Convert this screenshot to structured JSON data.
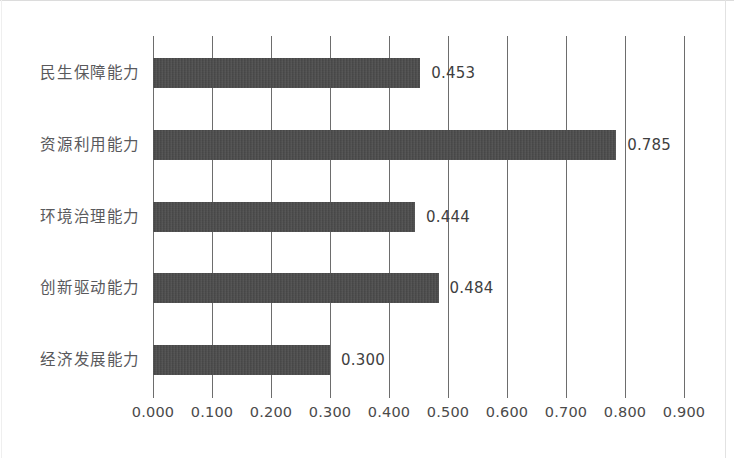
{
  "chart_data": {
    "type": "bar",
    "orientation": "horizontal",
    "title": "",
    "subtitle": "",
    "xlabel": "",
    "ylabel": "",
    "categories": [
      "民生保障能力",
      "资源利用能力",
      "环境治理能力",
      "创新驱动能力",
      "经济发展能力"
    ],
    "values": [
      0.453,
      0.785,
      0.444,
      0.484,
      0.3
    ],
    "value_labels": [
      "0.453",
      "0.785",
      "0.444",
      "0.484",
      "0.300"
    ],
    "xlim": [
      0.0,
      0.9
    ],
    "xticks": [
      0.0,
      0.1,
      0.2,
      0.3,
      0.4,
      0.5,
      0.6,
      0.7,
      0.8,
      0.9
    ],
    "xtick_labels": [
      "0.000",
      "0.100",
      "0.200",
      "0.300",
      "0.400",
      "0.500",
      "0.600",
      "0.700",
      "0.800",
      "0.900"
    ],
    "grid": "vertical",
    "legend": "none",
    "bar_color": "#4b4b4b",
    "grid_color": "#6d6d6d",
    "label_color": "#59595c",
    "tick_color": "#4a4a4a",
    "background_color": "#ffffff"
  }
}
